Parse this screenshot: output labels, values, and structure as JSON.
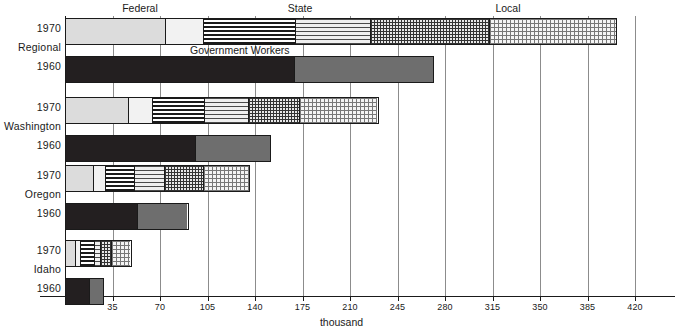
{
  "chart_data": {
    "type": "bar",
    "orientation": "horizontal",
    "title": "",
    "xlabel": "thousand",
    "ylabel": "",
    "xlim": [
      0,
      430
    ],
    "xticks": [
      35,
      70,
      105,
      140,
      175,
      210,
      245,
      280,
      315,
      350,
      385,
      420
    ],
    "xtick_labels": [
      "35",
      "70",
      "105",
      "140",
      "175",
      "210",
      "245",
      "280",
      "315",
      "350",
      "385",
      "420"
    ],
    "grid": "vertical",
    "legend_position": "top",
    "category_headers": [
      "Federal",
      "State",
      "Local"
    ],
    "annotation": "Government Workers",
    "groups": [
      "Regional",
      "Washington",
      "Oregon",
      "Idaho"
    ],
    "years": [
      "1970",
      "1960"
    ],
    "series": [
      {
        "name": "Federal - civilian",
        "fill": "f-lgray"
      },
      {
        "name": "Federal - military",
        "fill": "f-vlgray"
      },
      {
        "name": "State - education",
        "fill": "f-hdark"
      },
      {
        "name": "State - other",
        "fill": "f-hlight"
      },
      {
        "name": "Local - education",
        "fill": "f-griddark"
      },
      {
        "name": "Local - other",
        "fill": "f-gridlight"
      }
    ],
    "bars": [
      {
        "group": "Regional",
        "year": "1970",
        "total": 407,
        "segments": [
          {
            "series": "Federal - civilian",
            "value": 73,
            "fill": "f-lgray"
          },
          {
            "series": "Federal - military",
            "value": 28,
            "fill": "f-vlgray"
          },
          {
            "series": "State - education",
            "value": 68,
            "fill": "f-hdark"
          },
          {
            "series": "State - other",
            "value": 56,
            "fill": "f-hlight"
          },
          {
            "series": "Local - education",
            "value": 88,
            "fill": "f-griddark"
          },
          {
            "series": "Local - other",
            "value": 94,
            "fill": "f-gridlight"
          }
        ]
      },
      {
        "group": "Regional",
        "year": "1960",
        "total": 272,
        "segments": [
          {
            "series": "Federal",
            "value": 169,
            "fill": "f-black"
          },
          {
            "series": "State and Local",
            "value": 103,
            "fill": "f-mgray"
          }
        ]
      },
      {
        "group": "Washington",
        "year": "1970",
        "total": 231,
        "segments": [
          {
            "series": "Federal - civilian",
            "value": 46,
            "fill": "f-lgray"
          },
          {
            "series": "Federal - military",
            "value": 18,
            "fill": "f-vlgray"
          },
          {
            "series": "State - education",
            "value": 38,
            "fill": "f-hdark"
          },
          {
            "series": "State - other",
            "value": 33,
            "fill": "f-hlight"
          },
          {
            "series": "Local - education",
            "value": 38,
            "fill": "f-griddark"
          },
          {
            "series": "Local - other",
            "value": 58,
            "fill": "f-gridlight"
          }
        ]
      },
      {
        "group": "Washington",
        "year": "1960",
        "total": 152,
        "segments": [
          {
            "series": "Federal",
            "value": 96,
            "fill": "f-black"
          },
          {
            "series": "State and Local",
            "value": 56,
            "fill": "f-mgray"
          }
        ]
      },
      {
        "group": "Oregon",
        "year": "1970",
        "total": 136,
        "segments": [
          {
            "series": "Federal - civilian",
            "value": 20,
            "fill": "f-lgray"
          },
          {
            "series": "Federal - military",
            "value": 9,
            "fill": "f-vlgray"
          },
          {
            "series": "State - education",
            "value": 22,
            "fill": "f-hdark"
          },
          {
            "series": "State - other",
            "value": 22,
            "fill": "f-hlight"
          },
          {
            "series": "Local - education",
            "value": 29,
            "fill": "f-griddark"
          },
          {
            "series": "Local - other",
            "value": 34,
            "fill": "f-gridlight"
          }
        ]
      },
      {
        "group": "Oregon",
        "year": "1960",
        "total": 91,
        "segments": [
          {
            "series": "Federal",
            "value": 53,
            "fill": "f-black"
          },
          {
            "series": "State and Local",
            "value": 38,
            "fill": "f-mgray"
          }
        ]
      },
      {
        "group": "Idaho",
        "year": "1970",
        "total": 49,
        "segments": [
          {
            "series": "Federal - civilian",
            "value": 7,
            "fill": "f-lgray"
          },
          {
            "series": "Federal - military",
            "value": 4,
            "fill": "f-vlgray"
          },
          {
            "series": "State - education",
            "value": 10,
            "fill": "f-hdark"
          },
          {
            "series": "State - other",
            "value": 5,
            "fill": "f-hlight"
          },
          {
            "series": "Local - education",
            "value": 8,
            "fill": "f-griddark"
          },
          {
            "series": "Local - other",
            "value": 15,
            "fill": "f-gridlight"
          }
        ]
      },
      {
        "group": "Idaho",
        "year": "1960",
        "total": 29,
        "segments": [
          {
            "series": "Federal",
            "value": 18,
            "fill": "f-black"
          },
          {
            "series": "State and Local",
            "value": 11,
            "fill": "f-mgray"
          }
        ]
      }
    ]
  },
  "headers": {
    "federal": "Federal",
    "state": "State",
    "local": "Local"
  },
  "annotation": {
    "government_workers": "Government Workers"
  },
  "axis": {
    "title": "thousand"
  },
  "row_labels": {
    "r0": "1970",
    "r1": "1960",
    "r2": "1970",
    "r3": "1960",
    "r4": "1970",
    "r5": "1960",
    "r6": "1970",
    "r7": "1960"
  },
  "group_labels": {
    "g0": "Regional",
    "g1": "Washington",
    "g2": "Oregon",
    "g3": "Idaho"
  },
  "colors": {
    "ink": "#1a1a1a",
    "grid": "#8c8c8c",
    "black_fill": "#231f20",
    "mid_gray_fill": "#6e6e6e",
    "light_gray_fill": "#dcdcdc",
    "very_light_gray_fill": "#f2f2f2"
  }
}
